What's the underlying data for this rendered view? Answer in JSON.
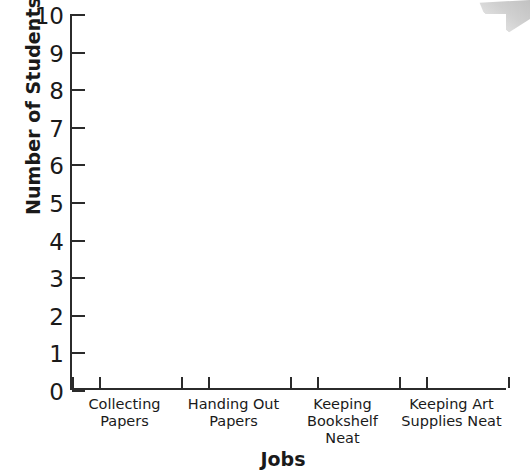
{
  "chart_data": {
    "type": "bar",
    "title": "",
    "xlabel": "Jobs",
    "ylabel": "Number of Students",
    "categories": [
      "Collecting Papers",
      "Handing Out Papers",
      "Keeping Bookshelf Neat",
      "Keeping Art Supplies Neat"
    ],
    "category_lines": [
      [
        "Collecting",
        "Papers"
      ],
      [
        "Handing Out",
        "Papers"
      ],
      [
        "Keeping",
        "Bookshelf",
        "Neat"
      ],
      [
        "Keeping Art",
        "Supplies Neat"
      ]
    ],
    "values": [
      0,
      0,
      0,
      0
    ],
    "ylim": [
      0,
      10
    ],
    "ytick_labels": [
      "10",
      "9",
      "8",
      "7",
      "6",
      "5",
      "4",
      "3",
      "2",
      "1",
      "0"
    ],
    "ytick_values": [
      10,
      9,
      8,
      7,
      6,
      5,
      4,
      3,
      2,
      1,
      0
    ],
    "ytick_step": 1,
    "grid": false,
    "legend": false,
    "bars_drawn": false,
    "note": "Blank bar graph template — axes only, no bars plotted",
    "colors": {
      "axis": "#2b2b2b",
      "text": "#1a1a1a",
      "background": "#ffffff",
      "artifact": "#c9c9c9"
    }
  },
  "axis": {
    "y_title": "Number of Students",
    "x_title": "Jobs"
  }
}
